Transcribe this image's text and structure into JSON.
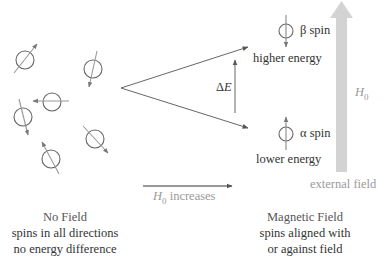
{
  "diagram": {
    "no_field": {
      "heading": "No Field",
      "line1": "spins in all directions",
      "line2": "no energy difference"
    },
    "magnetic_field": {
      "heading": "Magnetic Field",
      "line1": "spins aligned with",
      "line2": "or against field"
    },
    "beta": {
      "label": "β spin",
      "energy": "higher energy"
    },
    "alpha": {
      "label": "α spin",
      "energy": "lower energy"
    },
    "delta_e": {
      "symbol": "Δ",
      "var": "E"
    },
    "field_arrow": {
      "var": "H",
      "sub": "0",
      "caption": "external field"
    },
    "increase_arrow": {
      "var": "H",
      "sub": "0",
      "text": " increases"
    },
    "colors": {
      "line": "#555555",
      "field_arrow": "#d3d3d3",
      "muted_text": "#9a9a9a"
    }
  }
}
